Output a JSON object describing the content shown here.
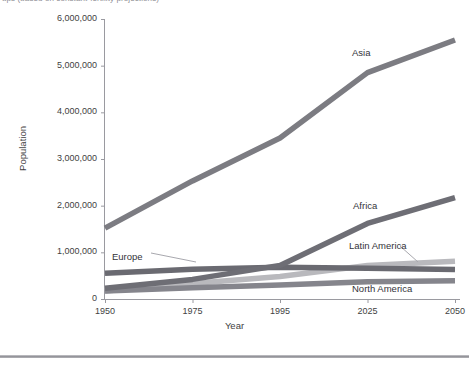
{
  "top_caption": "ups (based on constant-fertility projections)",
  "chart_data": {
    "type": "line",
    "title": "",
    "xlabel": "Year",
    "ylabel": "Population",
    "categories": [
      "1950",
      "1975",
      "1995",
      "2025",
      "2050"
    ],
    "x": [
      1950,
      1975,
      1995,
      2025,
      2050
    ],
    "ylim": [
      0,
      6000000
    ],
    "y_ticks": [
      "0",
      "1,000,000",
      "2,000,000",
      "3,000,000",
      "4,000,000",
      "5,000,000",
      "6,000,000"
    ],
    "y_tick_values": [
      0,
      1000000,
      2000000,
      3000000,
      4000000,
      5000000,
      6000000
    ],
    "grid": false,
    "legend_position": "inline-labels",
    "series": [
      {
        "name": "Asia",
        "color": "#7c7c82",
        "values": [
          1520000,
          2530000,
          3450000,
          4850000,
          5550000
        ],
        "label_x": 352,
        "label_y": 47
      },
      {
        "name": "Africa",
        "color": "#6e6e75",
        "values": [
          230000,
          420000,
          720000,
          1620000,
          2170000
        ],
        "label_x": 353,
        "label_y": 200
      },
      {
        "name": "Latin America",
        "color": "#b9b9bd",
        "values": [
          170000,
          330000,
          480000,
          720000,
          810000
        ],
        "label_x": 349,
        "label_y": 240
      },
      {
        "name": "Europe",
        "color": "#6a6a71",
        "values": [
          550000,
          640000,
          680000,
          660000,
          630000
        ],
        "label_x": 112,
        "label_y": 251
      },
      {
        "name": "North America",
        "color": "#85858c",
        "values": [
          170000,
          240000,
          300000,
          370000,
          390000
        ],
        "label_x": 352,
        "label_y": 283
      }
    ]
  }
}
